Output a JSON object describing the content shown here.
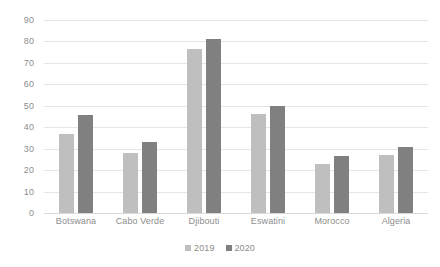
{
  "chart_data": {
    "type": "bar",
    "title": "",
    "subtitle": "",
    "xlabel": "",
    "ylabel": "",
    "ylim": [
      0,
      90
    ],
    "ytick_step": 10,
    "yticks": [
      90,
      80,
      70,
      60,
      50,
      40,
      30,
      20,
      10,
      0
    ],
    "grid": true,
    "legend_position": "bottom",
    "categories": [
      "Botswana",
      "Cabo Verde",
      "Djibouti",
      "Eswatini",
      "Morocco",
      "Algeria"
    ],
    "series": [
      {
        "name": "2019",
        "color": "#bfbfbf",
        "values": [
          37,
          28,
          76.5,
          46,
          23,
          27
        ]
      },
      {
        "name": "2020",
        "color": "#808080",
        "values": [
          45.5,
          33,
          81,
          50,
          26.5,
          31
        ]
      }
    ]
  },
  "style": {
    "background": "#ffffff",
    "gridline_color": "#e4e7ea",
    "baseline_color": "#d7dadd",
    "tick_text_color": "#8d8d8d"
  }
}
